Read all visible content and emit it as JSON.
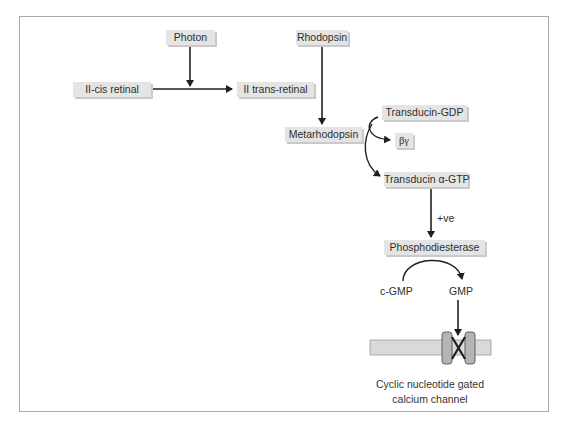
{
  "diagram": {
    "nodes": {
      "photon": "Photon",
      "cis_retinal": "II-cis retinal",
      "trans_retinal": "II trans-retinal",
      "rhodopsin": "Rhodopsin",
      "metarhodopsin": "Metarhodopsin",
      "transducin_gdp": "Transducin-GDP",
      "beta_gamma": "βγ",
      "transducin_gtp": "Transducin α-GTP",
      "phosphodiesterase": "Phosphodiesterase",
      "cgmp": "c-GMP",
      "gmp": "GMP"
    },
    "edge_labels": {
      "positive": "+ve"
    },
    "channel": {
      "caption_line1": "Cyclic nucleotide gated",
      "caption_line2": "calcium channel"
    },
    "edges": [
      {
        "from": "Photon",
        "to": "II-cis retinal → II trans-retinal conversion"
      },
      {
        "from": "II-cis retinal",
        "to": "II trans-retinal"
      },
      {
        "from": "Rhodopsin",
        "to": "Metarhodopsin"
      },
      {
        "from": "Transducin-GDP",
        "to": "βγ"
      },
      {
        "from": "Metarhodopsin",
        "to": "Transducin α-GTP"
      },
      {
        "from": "Transducin α-GTP",
        "to": "Phosphodiesterase",
        "label": "+ve"
      },
      {
        "from": "c-GMP",
        "to": "GMP"
      },
      {
        "from": "GMP",
        "to": "Cyclic nucleotide gated calcium channel"
      }
    ],
    "colors": {
      "box_fill": "#e4e4e4",
      "box_shadow": "#c9c9c9",
      "line": "#1f1f1f",
      "membrane": "#d9d9d9",
      "channel": "#b5b5b5",
      "frame": "#a9a9a9"
    }
  }
}
